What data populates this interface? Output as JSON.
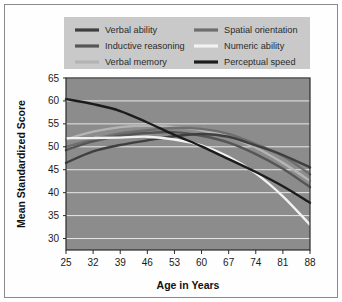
{
  "chart_data": {
    "type": "line",
    "title": "",
    "xlabel": "Age in Years",
    "ylabel": "Mean Standardized Score",
    "x": [
      25,
      32,
      39,
      46,
      53,
      60,
      67,
      74,
      81,
      88
    ],
    "xticklabels": [
      "25",
      "32",
      "39",
      "46",
      "53",
      "60",
      "67",
      "74",
      "81",
      "88"
    ],
    "yticks": [
      30,
      35,
      40,
      45,
      50,
      55,
      60,
      65
    ],
    "yticklabels": [
      "30",
      "35",
      "40",
      "45",
      "50",
      "55",
      "60",
      "65"
    ],
    "xlim": [
      25,
      88
    ],
    "ylim": [
      27.5,
      65
    ],
    "grid": true,
    "grid_color": "#e8e8e8",
    "plot_background": "#8c8c8c",
    "legend_position": "top",
    "legend_background": "#c9c9c9",
    "series": [
      {
        "name": "Verbal ability",
        "color": "#3f3f3f",
        "values": [
          46.5,
          49.0,
          50.4,
          51.4,
          52.3,
          52.8,
          52.2,
          50.3,
          48.2,
          45.5
        ]
      },
      {
        "name": "Inductive reasoning",
        "color": "#565656",
        "values": [
          49.3,
          51.2,
          52.4,
          53.0,
          53.2,
          52.4,
          50.9,
          48.4,
          45.2,
          41.2
        ]
      },
      {
        "name": "Verbal memory",
        "color": "#b4b4b4",
        "values": [
          51.6,
          53.3,
          54.3,
          54.6,
          54.3,
          53.6,
          52.2,
          49.8,
          46.5,
          42.6
        ]
      },
      {
        "name": "Spatial orientation",
        "color": "#6e6e6e",
        "values": [
          50.0,
          51.6,
          52.9,
          53.6,
          54.1,
          53.9,
          52.8,
          50.6,
          48.0,
          44.0
        ]
      },
      {
        "name": "Numeric ability",
        "color": "#f2f2f2",
        "values": [
          51.9,
          51.9,
          52.0,
          52.2,
          51.6,
          50.3,
          47.8,
          44.2,
          39.2,
          33.0
        ]
      },
      {
        "name": "Perceptual speed",
        "color": "#1c1c1c",
        "values": [
          60.4,
          59.3,
          57.8,
          55.3,
          52.6,
          50.1,
          47.3,
          44.5,
          41.4,
          37.8
        ]
      }
    ]
  },
  "legend": {
    "columns": [
      {
        "entries": [
          {
            "label": "Verbal ability",
            "series": "Verbal ability"
          },
          {
            "label": "Inductive reasoning",
            "series": "Inductive reasoning"
          },
          {
            "label": "Verbal memory",
            "series": "Verbal memory"
          }
        ]
      },
      {
        "entries": [
          {
            "label": "Spatial orientation",
            "series": "Spatial orientation"
          },
          {
            "label": "Numeric ability",
            "series": "Numeric ability"
          },
          {
            "label": "Perceptual speed",
            "series": "Perceptual speed"
          }
        ]
      }
    ]
  }
}
